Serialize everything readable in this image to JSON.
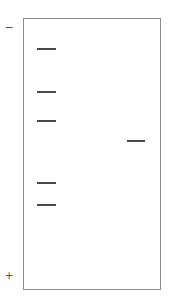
{
  "diagram": {
    "type": "gel-electrophoresis",
    "electrodes": {
      "negative_label": "−",
      "positive_label": "+"
    },
    "colors": {
      "band": "#4a4a4a",
      "border": "#8a8a8a",
      "background": "#ffffff"
    },
    "lanes": [
      {
        "name": "lane-1",
        "bands_y": [
          48,
          91,
          120,
          182,
          204
        ],
        "x": 37,
        "width": 19
      },
      {
        "name": "lane-2",
        "bands_y": [
          140
        ],
        "x": 127,
        "width": 18
      }
    ]
  }
}
